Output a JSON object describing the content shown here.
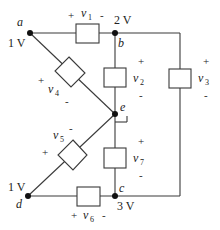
{
  "diagram": {
    "type": "circuit",
    "nodes": {
      "a": {
        "label": "a",
        "voltage": "1 V"
      },
      "b": {
        "label": "b",
        "voltage": "2 V"
      },
      "c": {
        "label": "c",
        "voltage": "3 V"
      },
      "d": {
        "label": "d",
        "voltage": "1 V"
      },
      "e": {
        "label": "e",
        "voltage": "",
        "grounded": true
      }
    },
    "elements": {
      "v1": {
        "name": "v",
        "sub": "1",
        "plus": "+",
        "minus": "-",
        "from": "a",
        "to": "b"
      },
      "v2": {
        "name": "v",
        "sub": "2",
        "plus": "+",
        "minus": "-",
        "from": "b",
        "to": "e"
      },
      "v3": {
        "name": "v",
        "sub": "3",
        "plus": "+",
        "minus": "-",
        "from": "b",
        "to": "c"
      },
      "v4": {
        "name": "v",
        "sub": "4",
        "plus": "+",
        "minus": "-",
        "from": "a",
        "to": "e"
      },
      "v5": {
        "name": "v",
        "sub": "5",
        "plus": "+",
        "minus": "-",
        "from": "d",
        "to": "e"
      },
      "v6": {
        "name": "v",
        "sub": "6",
        "plus": "+",
        "minus": "-",
        "from": "d",
        "to": "c"
      },
      "v7": {
        "name": "v",
        "sub": "7",
        "plus": "+",
        "minus": "-",
        "from": "e",
        "to": "c"
      }
    }
  }
}
